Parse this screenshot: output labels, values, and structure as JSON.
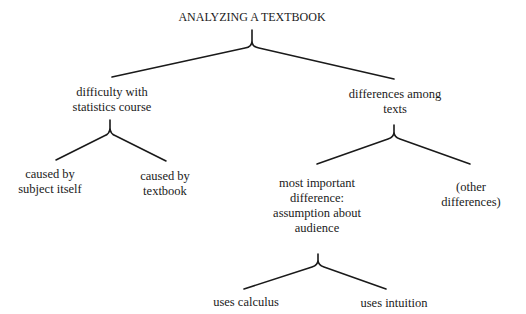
{
  "diagram": {
    "type": "tree",
    "root": {
      "label": "ANALYZING A TEXTBOOK",
      "children": [
        {
          "label": "difficulty with\nstatistics course",
          "children": [
            {
              "label": "caused by\nsubject itself"
            },
            {
              "label": "caused by\ntextbook"
            }
          ]
        },
        {
          "label": "differences among\ntexts",
          "children": [
            {
              "label": "most important\ndifference:\nassumption about\naudience",
              "children": [
                {
                  "label": "uses calculus"
                },
                {
                  "label": "uses intuition"
                }
              ]
            },
            {
              "label": "(other\ndifferences)"
            }
          ]
        }
      ]
    }
  },
  "nodes": {
    "root": {
      "line1": "ANALYZING A TEXTBOOK"
    },
    "difficulty": {
      "line1": "difficulty with",
      "line2": "statistics course"
    },
    "subject": {
      "line1": "caused by",
      "line2": "subject itself"
    },
    "textbook": {
      "line1": "caused by",
      "line2": "textbook"
    },
    "differences": {
      "line1": "differences among",
      "line2": "texts"
    },
    "important": {
      "line1": "most important",
      "line2": "difference:",
      "line3": "assumption about",
      "line4": "audience"
    },
    "other": {
      "line1": "(other",
      "line2": "differences)"
    },
    "calculus": {
      "line1": "uses calculus"
    },
    "intuition": {
      "line1": "uses intuition"
    }
  },
  "colors": {
    "line": "#1a1a1a",
    "text": "#1a1a1a",
    "background": "#ffffff"
  }
}
